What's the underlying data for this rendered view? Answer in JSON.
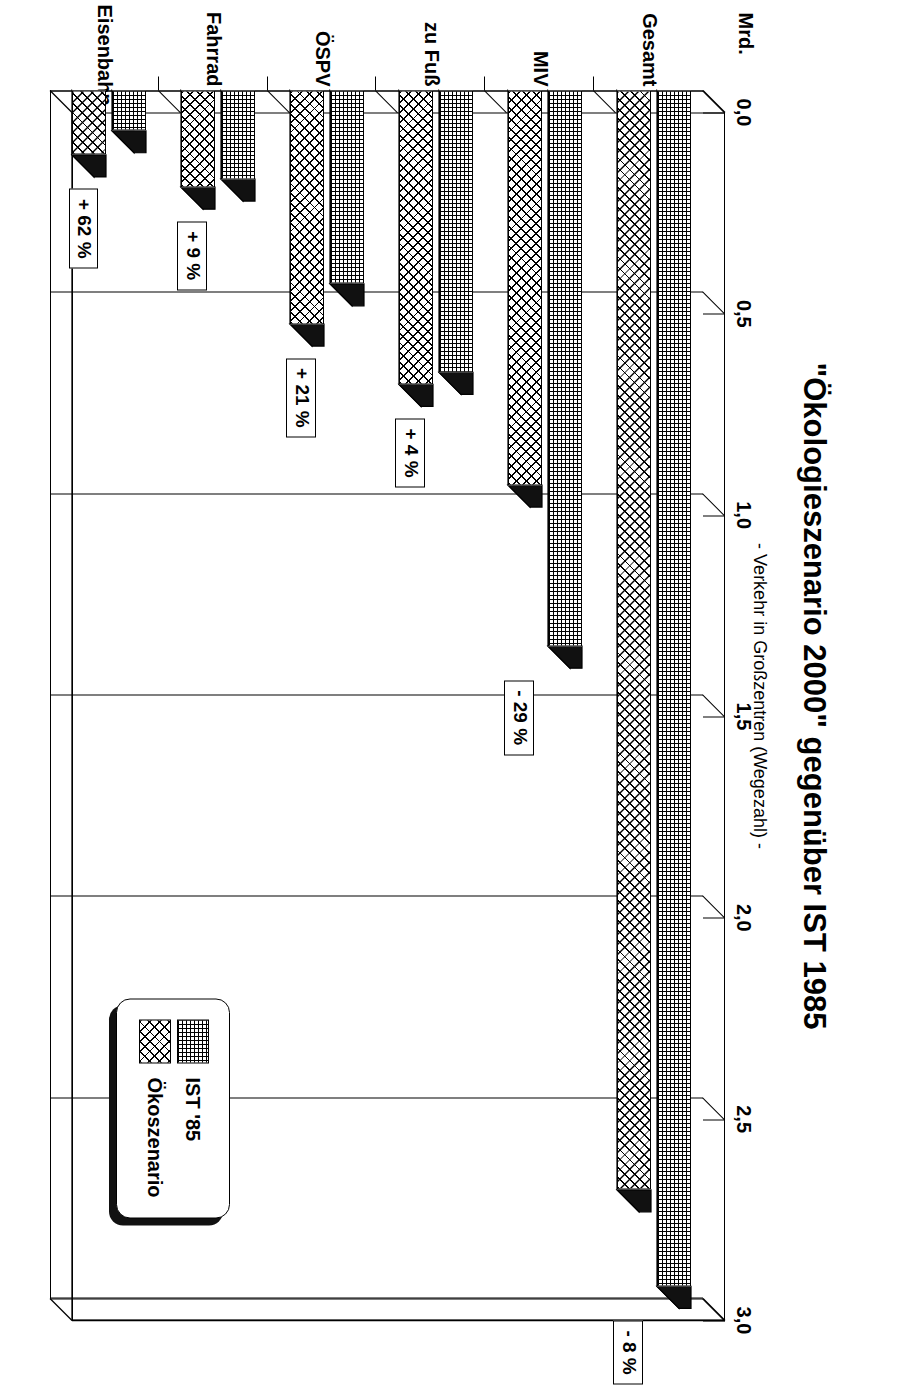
{
  "header": {
    "title": "\"Ökologieszenario 2000\" gegenüber IST 1985",
    "subtitle": "- Verkehr in Großzentren (Wegezahl) -"
  },
  "legend": {
    "items": [
      {
        "label": "IST '85",
        "pattern": "fine-grid"
      },
      {
        "label": "Ökoszenario",
        "pattern": "cross-hatch"
      }
    ]
  },
  "axis": {
    "unit_label": "Mrd.",
    "tick_labels": [
      "0,0",
      "0,5",
      "1,0",
      "1,5",
      "2,0",
      "2,5",
      "3,0"
    ]
  },
  "chart_data": {
    "type": "bar",
    "orientation": "horizontal",
    "title": "\"Ökologieszenario 2000\" gegenüber IST 1985",
    "subtitle": "- Verkehr in Großzentren (Wegezahl) -",
    "xlabel": "Mrd.",
    "ylabel": "",
    "xlim": [
      0.0,
      3.0
    ],
    "xticks": [
      0.0,
      0.5,
      1.0,
      1.5,
      2.0,
      2.5,
      3.0
    ],
    "xtick_labels": [
      "0,0",
      "0,5",
      "1,0",
      "1,5",
      "2,0",
      "2,5",
      "3,0"
    ],
    "grid": true,
    "legend_position": "bottom-right",
    "categories": [
      "Gesamt",
      "MIV",
      "zu Fuß",
      "ÖSPV",
      "Fahrrad",
      "Eisenbahn"
    ],
    "series": [
      {
        "name": "IST '85",
        "values": [
          2.97,
          1.38,
          0.7,
          0.48,
          0.22,
          0.1
        ]
      },
      {
        "name": "Ökoszenario",
        "values": [
          2.73,
          0.98,
          0.73,
          0.58,
          0.24,
          0.16
        ]
      }
    ],
    "annotations": [
      {
        "category": "Gesamt",
        "text": "-  8 %"
      },
      {
        "category": "MIV",
        "text": "-  29 %"
      },
      {
        "category": "zu Fuß",
        "text": "+  4 %"
      },
      {
        "category": "ÖSPV",
        "text": "+  21 %"
      },
      {
        "category": "Fahrrad",
        "text": "+  9 %"
      },
      {
        "category": "Eisenbahn",
        "text": "+  62 %"
      }
    ]
  },
  "colors": {
    "ink": "#000000",
    "paper": "#ffffff",
    "shadow": "#111111"
  }
}
